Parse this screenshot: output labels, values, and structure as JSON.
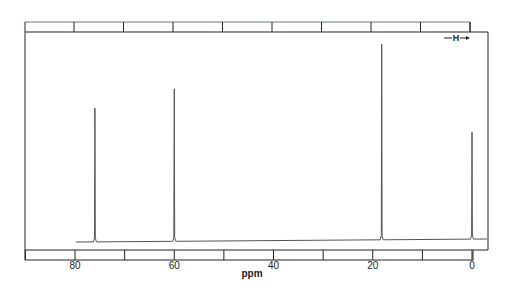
{
  "chart_data": {
    "type": "line",
    "title": "",
    "xlabel": "ppm",
    "ylabel": "",
    "xlim": [
      88,
      -3
    ],
    "x_reversed": true,
    "grid": false,
    "legend": null,
    "x_ticks": [
      80,
      60,
      40,
      20,
      0
    ],
    "x_tick_labels": [
      "80",
      "60",
      "40",
      "20",
      "0"
    ],
    "minor_tick_step": 10,
    "annotation": "H",
    "annotation_arrow": "right",
    "peaks": [
      {
        "ppm": 76.0,
        "relative_height": 0.65
      },
      {
        "ppm": 60.0,
        "relative_height": 0.74
      },
      {
        "ppm": 18.2,
        "relative_height": 0.95
      },
      {
        "ppm": 0.0,
        "relative_height": 0.52
      }
    ]
  },
  "axis": {
    "label": "ppm",
    "ticks": [
      "80",
      "60",
      "40",
      "20",
      "0"
    ]
  },
  "annotation": {
    "text": "H"
  },
  "colors": {
    "trace": "#555555",
    "frame": "#222222",
    "top_ruler_edge": "#5a8a6a"
  }
}
